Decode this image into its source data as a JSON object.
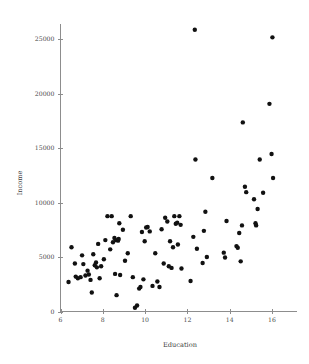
{
  "chart_data": {
    "type": "scatter",
    "title": "",
    "xlabel": "Education",
    "ylabel": "Income",
    "xlim": [
      5.6,
      17.0
    ],
    "ylim": [
      0,
      26500
    ],
    "grid": false,
    "legend": null,
    "marker": {
      "shape": "circle",
      "color": "#111111",
      "size": 2.2
    },
    "xticks": [
      6,
      8,
      10,
      12,
      14,
      16
    ],
    "xtick_labels": [
      "6",
      "8",
      "10",
      "12",
      "14",
      "16"
    ],
    "yticks": [
      0,
      5000,
      10000,
      15000,
      20000,
      25000
    ],
    "ytick_labels": [
      "0",
      "5000",
      "10000",
      "15000",
      "20000",
      "25000"
    ],
    "points": [
      {
        "x": 6.38,
        "y": 2700
      },
      {
        "x": 6.52,
        "y": 5900
      },
      {
        "x": 6.68,
        "y": 4400
      },
      {
        "x": 6.72,
        "y": 3200
      },
      {
        "x": 6.82,
        "y": 3050
      },
      {
        "x": 6.95,
        "y": 3150
      },
      {
        "x": 7.02,
        "y": 5150
      },
      {
        "x": 7.08,
        "y": 4350
      },
      {
        "x": 7.18,
        "y": 3300
      },
      {
        "x": 7.28,
        "y": 3750
      },
      {
        "x": 7.34,
        "y": 3400
      },
      {
        "x": 7.42,
        "y": 2900
      },
      {
        "x": 7.48,
        "y": 1750
      },
      {
        "x": 7.55,
        "y": 5250
      },
      {
        "x": 7.62,
        "y": 4250
      },
      {
        "x": 7.68,
        "y": 4500
      },
      {
        "x": 7.72,
        "y": 4050
      },
      {
        "x": 7.78,
        "y": 6200
      },
      {
        "x": 7.85,
        "y": 3050
      },
      {
        "x": 7.92,
        "y": 4150
      },
      {
        "x": 8.05,
        "y": 4800
      },
      {
        "x": 8.12,
        "y": 6550
      },
      {
        "x": 8.22,
        "y": 8750
      },
      {
        "x": 8.35,
        "y": 5700
      },
      {
        "x": 8.42,
        "y": 8750
      },
      {
        "x": 8.48,
        "y": 6350
      },
      {
        "x": 8.55,
        "y": 6750
      },
      {
        "x": 8.58,
        "y": 3450
      },
      {
        "x": 8.62,
        "y": 6550
      },
      {
        "x": 8.65,
        "y": 1500
      },
      {
        "x": 8.72,
        "y": 6500
      },
      {
        "x": 8.75,
        "y": 6650
      },
      {
        "x": 8.78,
        "y": 8100
      },
      {
        "x": 8.82,
        "y": 3350
      },
      {
        "x": 8.95,
        "y": 7500
      },
      {
        "x": 9.05,
        "y": 4650
      },
      {
        "x": 9.18,
        "y": 5350
      },
      {
        "x": 9.32,
        "y": 8750
      },
      {
        "x": 9.42,
        "y": 3150
      },
      {
        "x": 9.52,
        "y": 350
      },
      {
        "x": 9.62,
        "y": 550
      },
      {
        "x": 9.72,
        "y": 2100
      },
      {
        "x": 9.78,
        "y": 2250
      },
      {
        "x": 9.85,
        "y": 7300
      },
      {
        "x": 9.92,
        "y": 2950
      },
      {
        "x": 9.98,
        "y": 6450
      },
      {
        "x": 10.05,
        "y": 7700
      },
      {
        "x": 10.12,
        "y": 7750
      },
      {
        "x": 10.22,
        "y": 7350
      },
      {
        "x": 10.35,
        "y": 2350
      },
      {
        "x": 10.48,
        "y": 5350
      },
      {
        "x": 10.58,
        "y": 2750
      },
      {
        "x": 10.68,
        "y": 2250
      },
      {
        "x": 10.78,
        "y": 7550
      },
      {
        "x": 10.88,
        "y": 4400
      },
      {
        "x": 10.95,
        "y": 8600
      },
      {
        "x": 11.05,
        "y": 8250
      },
      {
        "x": 11.12,
        "y": 4150
      },
      {
        "x": 11.18,
        "y": 6450
      },
      {
        "x": 11.25,
        "y": 4000
      },
      {
        "x": 11.32,
        "y": 5900
      },
      {
        "x": 11.38,
        "y": 8750
      },
      {
        "x": 11.45,
        "y": 8050
      },
      {
        "x": 11.52,
        "y": 8150
      },
      {
        "x": 11.55,
        "y": 6150
      },
      {
        "x": 11.62,
        "y": 8750
      },
      {
        "x": 11.68,
        "y": 7950
      },
      {
        "x": 11.72,
        "y": 3950
      },
      {
        "x": 12.15,
        "y": 2800
      },
      {
        "x": 12.28,
        "y": 6850
      },
      {
        "x": 12.35,
        "y": 25850
      },
      {
        "x": 12.38,
        "y": 13950
      },
      {
        "x": 12.45,
        "y": 5750
      },
      {
        "x": 12.72,
        "y": 4450
      },
      {
        "x": 12.78,
        "y": 7400
      },
      {
        "x": 12.85,
        "y": 9150
      },
      {
        "x": 12.92,
        "y": 5000
      },
      {
        "x": 13.18,
        "y": 12250
      },
      {
        "x": 13.72,
        "y": 5400
      },
      {
        "x": 13.78,
        "y": 4950
      },
      {
        "x": 13.85,
        "y": 8300
      },
      {
        "x": 14.32,
        "y": 6000
      },
      {
        "x": 14.38,
        "y": 5850
      },
      {
        "x": 14.45,
        "y": 7200
      },
      {
        "x": 14.52,
        "y": 4600
      },
      {
        "x": 14.58,
        "y": 7900
      },
      {
        "x": 14.62,
        "y": 17350
      },
      {
        "x": 14.72,
        "y": 11450
      },
      {
        "x": 14.78,
        "y": 10950
      },
      {
        "x": 15.15,
        "y": 10300
      },
      {
        "x": 15.22,
        "y": 8100
      },
      {
        "x": 15.25,
        "y": 7900
      },
      {
        "x": 15.32,
        "y": 9400
      },
      {
        "x": 15.42,
        "y": 13950
      },
      {
        "x": 15.58,
        "y": 10900
      },
      {
        "x": 15.88,
        "y": 19050
      },
      {
        "x": 15.98,
        "y": 14450
      },
      {
        "x": 16.02,
        "y": 25150
      },
      {
        "x": 16.05,
        "y": 12250
      }
    ]
  },
  "axes": {
    "x_title": "Education",
    "y_title": "Income"
  },
  "colors": {
    "axis": "#8d8d8d",
    "tick_text": "#4a4a4a",
    "point": "#111111",
    "background": "#ffffff"
  }
}
